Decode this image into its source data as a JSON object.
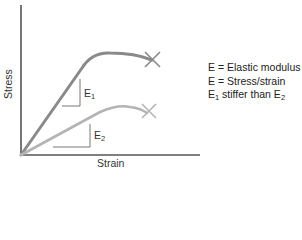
{
  "diagram": {
    "axes": {
      "x_label": "Strain",
      "y_label": "Stress"
    },
    "curves": [
      {
        "name": "Material 1",
        "slope_label": "E",
        "slope_sub": "1",
        "color": "#8a8a8a",
        "end_marker": "X"
      },
      {
        "name": "Material 2",
        "slope_label": "E",
        "slope_sub": "2",
        "color": "#b4b4b4",
        "end_marker": "X"
      }
    ],
    "legend": [
      {
        "text": "E = Elastic modulus"
      },
      {
        "text": "E = Stress/strain"
      },
      {
        "pre": "E",
        "sub1": "1",
        "mid": " stiffer than E",
        "sub2": "2"
      }
    ]
  }
}
